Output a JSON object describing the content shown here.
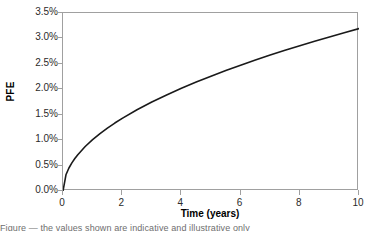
{
  "chart_data": {
    "type": "line",
    "title": "",
    "subtitle": "",
    "xlabel": "Time (years)",
    "ylabel": "PFE",
    "xlim": [
      0,
      10
    ],
    "ylim": [
      0,
      0.035
    ],
    "grid": false,
    "legend": null,
    "legend_position": "none",
    "x_ticks": [
      0,
      2,
      4,
      6,
      8,
      10
    ],
    "x_tick_labels": [
      "0",
      "2",
      "4",
      "6",
      "8",
      "10"
    ],
    "y_ticks": [
      0.0,
      0.005,
      0.01,
      0.015,
      0.02,
      0.025,
      0.03,
      0.035
    ],
    "y_tick_labels": [
      "0.0%",
      "0.5%",
      "1.0%",
      "1.5%",
      "2.0%",
      "2.5%",
      "3.0%",
      "3.5%"
    ],
    "series": [
      {
        "name": "PFE",
        "color": "#1a1a1a",
        "x": [
          0.0,
          0.1,
          0.2,
          0.3,
          0.4,
          0.5,
          0.75,
          1.0,
          1.25,
          1.5,
          1.75,
          2.0,
          2.5,
          3.0,
          3.5,
          4.0,
          4.5,
          5.0,
          5.5,
          6.0,
          6.5,
          7.0,
          7.5,
          8.0,
          8.5,
          9.0,
          9.5,
          10.0
        ],
        "values": [
          0.0,
          0.00319,
          0.00452,
          0.00553,
          0.00639,
          0.00714,
          0.00875,
          0.0101,
          0.01129,
          0.01237,
          0.01336,
          0.01428,
          0.01597,
          0.01749,
          0.01889,
          0.0202,
          0.02142,
          0.02258,
          0.02368,
          0.02474,
          0.02575,
          0.02672,
          0.02766,
          0.02857,
          0.02944,
          0.0303,
          0.03113,
          0.03194
        ]
      }
    ],
    "annotations": []
  },
  "axes": {
    "y_title": "PFE",
    "x_title": "Time (years)"
  },
  "caption": {
    "clipped_text": "Figure — the values shown are indicative and illustrative only"
  },
  "colors": {
    "curve": "#1a1a1a",
    "frame": "#a0a0a0",
    "tick": "#a0a0a0",
    "label": "#2b2b2b",
    "background": "#ffffff"
  }
}
